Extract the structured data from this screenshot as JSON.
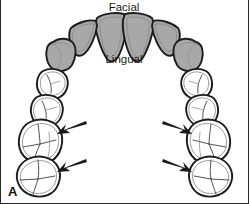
{
  "figure": {
    "panel_letter": "A",
    "labels": {
      "facial": "Facial",
      "lingual": "Lingual"
    },
    "colors": {
      "anterior_fill": "#a8a8a8",
      "posterior_fill": "#ffffff",
      "outline": "#1c1c1c",
      "arrow": "#1a1a1a",
      "background": "#ffffff"
    },
    "teeth": [
      {
        "id": "right-central-incisor",
        "type": "incisor",
        "shaded": true,
        "cx": 110,
        "cy": 28
      },
      {
        "id": "left-central-incisor",
        "type": "incisor",
        "shaded": true,
        "cx": 140,
        "cy": 28
      },
      {
        "id": "right-lateral-incisor",
        "type": "incisor",
        "shaded": true,
        "cx": 82,
        "cy": 36
      },
      {
        "id": "left-lateral-incisor",
        "type": "incisor",
        "shaded": true,
        "cx": 168,
        "cy": 36
      },
      {
        "id": "right-canine",
        "type": "canine",
        "shaded": true,
        "cx": 60,
        "cy": 55
      },
      {
        "id": "left-canine",
        "type": "canine",
        "shaded": true,
        "cx": 190,
        "cy": 55
      },
      {
        "id": "right-first-premolar",
        "type": "premolar",
        "shaded": false,
        "cx": 50,
        "cy": 85
      },
      {
        "id": "left-first-premolar",
        "type": "premolar",
        "shaded": false,
        "cx": 200,
        "cy": 85
      },
      {
        "id": "right-second-premolar",
        "type": "premolar",
        "shaded": false,
        "cx": 43,
        "cy": 110
      },
      {
        "id": "left-second-premolar",
        "type": "premolar",
        "shaded": false,
        "cx": 207,
        "cy": 110
      },
      {
        "id": "right-first-molar",
        "type": "molar",
        "shaded": false,
        "cx": 37,
        "cy": 140
      },
      {
        "id": "left-first-molar",
        "type": "molar",
        "shaded": false,
        "cx": 213,
        "cy": 140
      },
      {
        "id": "right-second-molar",
        "type": "molar",
        "shaded": false,
        "cx": 35,
        "cy": 176
      },
      {
        "id": "left-second-molar",
        "type": "molar",
        "shaded": false,
        "cx": 215,
        "cy": 176
      }
    ],
    "arrows": [
      {
        "id": "arrow-right-first-molar",
        "points_to": "right-first-molar",
        "from_x": 84,
        "from_y": 124,
        "to_x": 58,
        "to_y": 136
      },
      {
        "id": "arrow-left-first-molar",
        "points_to": "left-first-molar",
        "from_x": 166,
        "from_y": 124,
        "to_x": 192,
        "to_y": 136
      },
      {
        "id": "arrow-right-second-molar",
        "points_to": "right-second-molar",
        "from_x": 84,
        "from_y": 162,
        "to_x": 58,
        "to_y": 172
      },
      {
        "id": "arrow-left-second-molar",
        "points_to": "left-second-molar",
        "from_x": 166,
        "from_y": 162,
        "to_x": 192,
        "to_y": 172
      }
    ]
  }
}
